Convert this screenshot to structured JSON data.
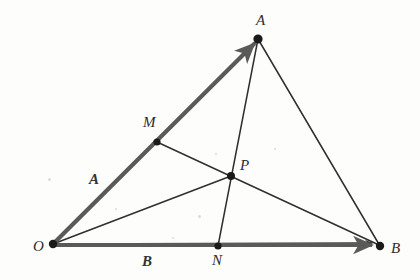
{
  "figure": {
    "canvas": {
      "width": 420,
      "height": 280
    },
    "background_color": "#fdfdfc",
    "vector_color": "#5a5a5a",
    "line_color": "#2f2f2f",
    "point_color": "#1a1a1a",
    "label_color": "#2b2b2b"
  },
  "points": [
    {
      "id": "O",
      "label": "O",
      "x": 53,
      "y": 244,
      "label_x": 33,
      "label_y": 239,
      "dot_r": 4.2
    },
    {
      "id": "A",
      "label": "A",
      "x": 258,
      "y": 39,
      "label_x": 256,
      "label_y": 13,
      "dot_r": 4.6
    },
    {
      "id": "B",
      "label": "B",
      "x": 380,
      "y": 246,
      "label_x": 391,
      "label_y": 241,
      "dot_r": 4.2
    },
    {
      "id": "M",
      "label": "M",
      "x": 157,
      "y": 142,
      "label_x": 143,
      "label_y": 115,
      "dot_r": 3.6
    },
    {
      "id": "N",
      "label": "N",
      "x": 218,
      "y": 246,
      "label_x": 212,
      "label_y": 253,
      "dot_r": 3.6
    },
    {
      "id": "P",
      "label": "P",
      "x": 231,
      "y": 176,
      "label_x": 240,
      "label_y": 158,
      "dot_r": 4.0
    }
  ],
  "vectors": [
    {
      "id": "OA",
      "label": "A",
      "from": "O",
      "to": "A",
      "label_x": 89,
      "label_y": 172,
      "stroke": "#5a5a5a",
      "width": 4.2
    },
    {
      "id": "OB",
      "label": "B",
      "from": "O",
      "to": "B",
      "label_x": 142,
      "label_y": 254,
      "stroke": "#5a5a5a",
      "width": 4.2
    }
  ],
  "segments": [
    {
      "id": "AB",
      "from": "A",
      "to": "B",
      "stroke": "#2f2f2f",
      "width": 1.5
    },
    {
      "id": "MB",
      "from": "M",
      "to": "B",
      "stroke": "#2f2f2f",
      "width": 1.5
    },
    {
      "id": "AN",
      "from": "A",
      "to": "N",
      "stroke": "#2f2f2f",
      "width": 1.5
    },
    {
      "id": "OB-thin",
      "from": "O",
      "to": "B",
      "stroke": "#2f2f2f",
      "width": 1.4
    }
  ],
  "specks": [
    {
      "x": 48,
      "y": 178,
      "d": 3
    },
    {
      "x": 115,
      "y": 208,
      "d": 2
    },
    {
      "x": 198,
      "y": 215,
      "d": 3
    },
    {
      "x": 172,
      "y": 237,
      "d": 2
    },
    {
      "x": 274,
      "y": 148,
      "d": 2
    },
    {
      "x": 215,
      "y": 153,
      "d": 2
    }
  ]
}
